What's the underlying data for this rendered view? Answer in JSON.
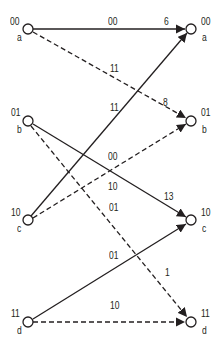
{
  "nodes": {
    "left": [
      {
        "id": "a",
        "state": "00",
        "name": "a"
      },
      {
        "id": "b",
        "state": "01",
        "name": "b"
      },
      {
        "id": "c",
        "state": "10",
        "name": "c"
      },
      {
        "id": "d",
        "state": "11",
        "name": "d"
      }
    ],
    "right": [
      {
        "id": "a",
        "state": "00",
        "name": "a"
      },
      {
        "id": "b",
        "state": "01",
        "name": "b"
      },
      {
        "id": "c",
        "state": "10",
        "name": "c"
      },
      {
        "id": "d",
        "state": "11",
        "name": "d"
      }
    ]
  },
  "edges": [
    {
      "from": "a",
      "to": "a",
      "style": "solid",
      "output": "00"
    },
    {
      "from": "a",
      "to": "b",
      "style": "dashed",
      "output": "11"
    },
    {
      "from": "b",
      "to": "c",
      "style": "solid",
      "output": "00"
    },
    {
      "from": "b",
      "to": "d",
      "style": "dashed",
      "output": "01"
    },
    {
      "from": "c",
      "to": "a",
      "style": "solid",
      "output": "11"
    },
    {
      "from": "c",
      "to": "b",
      "style": "dashed",
      "output": "10"
    },
    {
      "from": "d",
      "to": "c",
      "style": "solid",
      "output": "01"
    },
    {
      "from": "d",
      "to": "d",
      "style": "dashed",
      "output": "10"
    }
  ],
  "metrics": {
    "a": "6",
    "b": "8",
    "c": "13",
    "d": "1"
  },
  "colors": {
    "line": "#231f20",
    "node_fill": "#ffffff"
  }
}
